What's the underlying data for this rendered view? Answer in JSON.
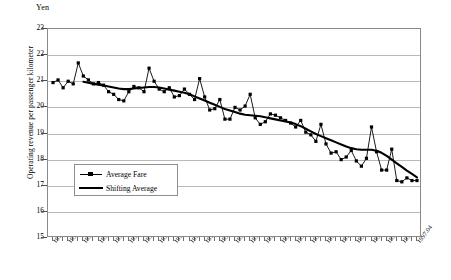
{
  "chart_data": {
    "type": "line",
    "title": "",
    "unit_label": "Yen",
    "ylabel": "Operating revenue per passenger kilometer",
    "xlabel": "",
    "ylim": [
      15,
      23
    ],
    "yticks": [
      15,
      16,
      17,
      18,
      19,
      20,
      21,
      22,
      23
    ],
    "grid": true,
    "legend_position": "inside-lower-left",
    "x_tick_labels": [
      "1991.04",
      "1991.07",
      "1991.10",
      "1992.01",
      "1992.04",
      "1992.07",
      "1992.10",
      "1993.01",
      "1993.04",
      "1993.07",
      "1993.10",
      "1994.01",
      "1994.04",
      "1994.07",
      "1994.10",
      "1995.01",
      "1995.04",
      "1995.07",
      "1995.10",
      "1996.01",
      "1996.04",
      "1996.07",
      "1996.10",
      "1997.01",
      "1997.04"
    ],
    "x_tick_label_step_months": 3,
    "x": [
      "1991.04",
      "1991.05",
      "1991.06",
      "1991.07",
      "1991.08",
      "1991.09",
      "1991.10",
      "1991.11",
      "1991.12",
      "1992.01",
      "1992.02",
      "1992.03",
      "1992.04",
      "1992.05",
      "1992.06",
      "1992.07",
      "1992.08",
      "1992.09",
      "1992.10",
      "1992.11",
      "1992.12",
      "1993.01",
      "1993.02",
      "1993.03",
      "1993.04",
      "1993.05",
      "1993.06",
      "1993.07",
      "1993.08",
      "1993.09",
      "1993.10",
      "1993.11",
      "1993.12",
      "1994.01",
      "1994.02",
      "1994.03",
      "1994.04",
      "1994.05",
      "1994.06",
      "1994.07",
      "1994.08",
      "1994.09",
      "1994.10",
      "1994.11",
      "1994.12",
      "1995.01",
      "1995.02",
      "1995.03",
      "1995.04",
      "1995.05",
      "1995.06",
      "1995.07",
      "1995.08",
      "1995.09",
      "1995.10",
      "1995.11",
      "1995.12",
      "1996.01",
      "1996.02",
      "1996.03",
      "1996.04",
      "1996.05",
      "1996.06",
      "1996.07",
      "1996.08",
      "1996.09",
      "1996.10",
      "1996.11",
      "1996.12",
      "1997.01",
      "1997.02",
      "1997.03",
      "1997.04"
    ],
    "series": [
      {
        "name": "Average Fare",
        "style": "line-with-square-markers",
        "color": "#000000",
        "values": [
          20.95,
          21.05,
          20.75,
          21.0,
          20.9,
          21.7,
          21.2,
          21.05,
          20.9,
          20.95,
          20.85,
          20.6,
          20.5,
          20.3,
          20.25,
          20.6,
          20.8,
          20.75,
          20.6,
          21.5,
          21.0,
          20.7,
          20.6,
          20.75,
          20.4,
          20.45,
          20.7,
          20.5,
          20.3,
          21.1,
          20.4,
          19.9,
          19.95,
          20.3,
          19.55,
          19.55,
          20.0,
          19.9,
          20.05,
          20.5,
          19.6,
          19.35,
          19.45,
          19.75,
          19.7,
          19.6,
          19.5,
          19.4,
          19.25,
          19.5,
          19.05,
          18.95,
          18.7,
          19.35,
          18.6,
          18.25,
          18.3,
          18.0,
          18.1,
          18.35,
          17.95,
          17.75,
          18.05,
          19.25,
          18.3,
          17.6,
          17.6,
          18.4,
          17.2,
          17.15,
          17.3,
          17.2,
          17.2
        ]
      },
      {
        "name": "Shifting Average",
        "style": "thick-line",
        "color": "#000000",
        "values": [
          null,
          null,
          null,
          null,
          null,
          null,
          20.98,
          20.94,
          20.9,
          20.87,
          20.84,
          20.8,
          20.76,
          20.72,
          20.7,
          20.7,
          20.72,
          20.74,
          20.76,
          20.78,
          20.78,
          20.76,
          20.72,
          20.68,
          20.64,
          20.6,
          20.56,
          20.5,
          20.42,
          20.34,
          20.26,
          20.18,
          20.1,
          20.02,
          19.94,
          19.88,
          19.82,
          19.76,
          19.72,
          19.7,
          19.68,
          19.66,
          19.62,
          19.58,
          19.54,
          19.5,
          19.46,
          19.42,
          19.36,
          19.28,
          19.18,
          19.08,
          18.98,
          18.9,
          18.82,
          18.74,
          18.66,
          18.58,
          18.5,
          18.44,
          18.4,
          18.38,
          18.38,
          18.38,
          18.34,
          18.26,
          18.14,
          18.0,
          17.86,
          17.72,
          17.58,
          17.45,
          17.32
        ]
      }
    ],
    "legend_entries": [
      {
        "label": "Average Fare",
        "marker": "square",
        "line": "thin"
      },
      {
        "label": "Shifting Average",
        "marker": "none",
        "line": "thick"
      }
    ]
  }
}
